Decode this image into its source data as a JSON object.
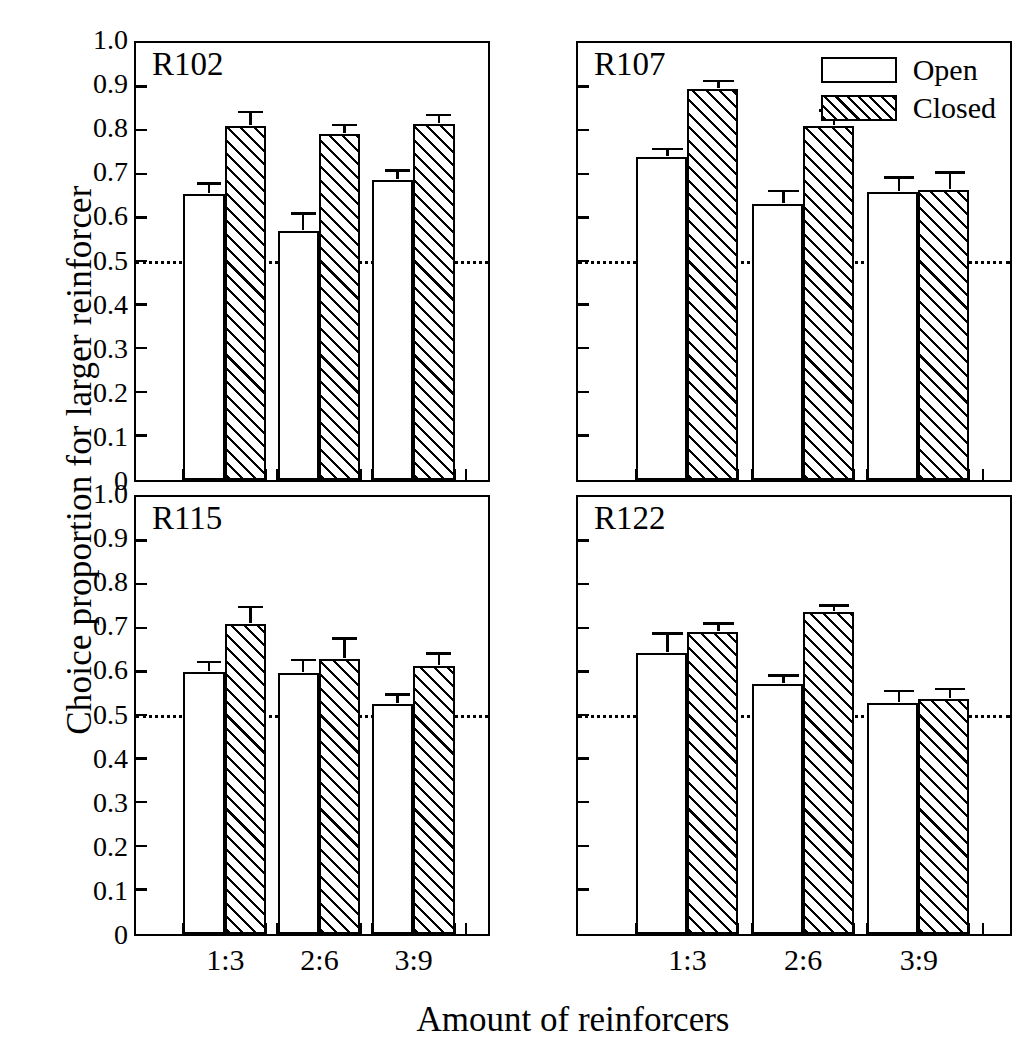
{
  "chart_data": {
    "type": "bar",
    "title": "",
    "xlabel": "Amount of reinforcers",
    "ylabel": "Choice proportion for larger reinforcer",
    "categories": [
      "1:3",
      "2:6",
      "3:9"
    ],
    "ylim": [
      0,
      1.0
    ],
    "ytick_labels": [
      "1.0",
      "0.9",
      "0.8",
      "0.7",
      "0.6",
      "0.5",
      "0.4",
      "0.3",
      "0.2",
      "0.1",
      "0"
    ],
    "ytick_values": [
      1.0,
      0.9,
      0.8,
      0.7,
      0.6,
      0.5,
      0.4,
      0.3,
      0.2,
      0.1,
      0
    ],
    "grid": false,
    "reference_line": 0.5,
    "legend": {
      "position": "top-right-of-panel-R107",
      "entries": [
        {
          "name": "Open",
          "fill": "white"
        },
        {
          "name": "Closed",
          "fill": "diagonal-hatch"
        }
      ]
    },
    "error_bars": "standard error of the mean",
    "panels": [
      {
        "label": "R102",
        "position": "top-left",
        "series": [
          {
            "name": "Open",
            "values": [
              0.657,
              0.571,
              0.688
            ],
            "errors": [
              0.024,
              0.041,
              0.022
            ]
          },
          {
            "name": "Closed",
            "values": [
              0.811,
              0.793,
              0.816
            ],
            "errors": [
              0.034,
              0.022,
              0.022
            ]
          }
        ]
      },
      {
        "label": "R107",
        "position": "top-right",
        "series": [
          {
            "name": "Open",
            "values": [
              0.741,
              0.634,
              0.661
            ],
            "errors": [
              0.019,
              0.029,
              0.033
            ]
          },
          {
            "name": "Closed",
            "values": [
              0.896,
              0.812,
              0.665
            ],
            "errors": [
              0.02,
              0.036,
              0.041
            ]
          }
        ]
      },
      {
        "label": "R115",
        "position": "bottom-left",
        "series": [
          {
            "name": "Open",
            "values": [
              0.602,
              0.598,
              0.527
            ],
            "errors": [
              0.023,
              0.031,
              0.023
            ]
          },
          {
            "name": "Closed",
            "values": [
              0.711,
              0.63,
              0.614
            ],
            "errors": [
              0.04,
              0.048,
              0.03
            ]
          }
        ]
      },
      {
        "label": "R122",
        "position": "bottom-right",
        "series": [
          {
            "name": "Open",
            "values": [
              0.645,
              0.573,
              0.53
            ],
            "errors": [
              0.045,
              0.02,
              0.028
            ]
          },
          {
            "name": "Closed",
            "values": [
              0.692,
              0.739,
              0.538
            ],
            "errors": [
              0.021,
              0.015,
              0.025
            ]
          }
        ]
      }
    ]
  },
  "axes": {
    "ylabel": "Choice proportion for larger reinforcer",
    "xlabel": "Amount of reinforcers"
  },
  "legend": {
    "open_label": "Open",
    "closed_label": "Closed"
  },
  "panel_titles": {
    "top_left": "R102",
    "top_right": "R107",
    "bottom_left": "R115",
    "bottom_right": "R122"
  },
  "xticks": {
    "labels": [
      "1:3",
      "2:6",
      "3:9"
    ]
  },
  "yticks": {
    "labels": [
      "1.0",
      "0.9",
      "0.8",
      "0.7",
      "0.6",
      "0.5",
      "0.4",
      "0.3",
      "0.2",
      "0.1",
      "0"
    ]
  }
}
